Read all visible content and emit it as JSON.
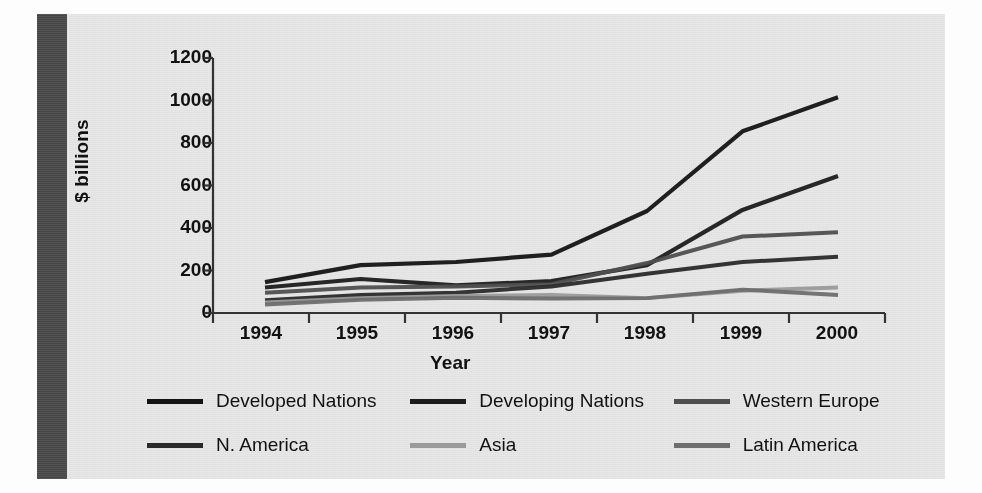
{
  "figure": {
    "background_color": "#e8e8e8",
    "spine_color": "#4a4a4a"
  },
  "chart_data": {
    "type": "line",
    "title": "",
    "xlabel": "Year",
    "ylabel": "$ billions",
    "categories": [
      "1994",
      "1995",
      "1996",
      "1997",
      "1998",
      "1999",
      "2000"
    ],
    "ylim": [
      0,
      1200
    ],
    "yticks": [
      0,
      200,
      400,
      600,
      800,
      1000,
      1200
    ],
    "ytick_labels": [
      "0",
      "200",
      "400",
      "600",
      "800",
      "1000",
      "1200"
    ],
    "grid": false,
    "legend_position": "bottom",
    "series": [
      {
        "name": "Developed Nations",
        "color": "#141414",
        "width": 4.2,
        "values": [
          145,
          225,
          240,
          275,
          480,
          855,
          1015
        ]
      },
      {
        "name": "Developing Nations",
        "color": "#1c1c1c",
        "width": 4.2,
        "values": [
          120,
          160,
          130,
          150,
          225,
          485,
          645
        ]
      },
      {
        "name": "Western Europe",
        "color": "#4f4f4f",
        "width": 4.0,
        "values": [
          95,
          120,
          125,
          135,
          235,
          360,
          380
        ]
      },
      {
        "name": "N. America",
        "color": "#2a2a2a",
        "width": 4.0,
        "values": [
          60,
          85,
          95,
          125,
          185,
          240,
          265
        ]
      },
      {
        "name": "Asia",
        "color": "#9a9a9a",
        "width": 4.0,
        "values": [
          50,
          70,
          80,
          85,
          70,
          105,
          120
        ]
      },
      {
        "name": "Latin America",
        "color": "#6e6e6e",
        "width": 4.0,
        "values": [
          40,
          62,
          72,
          68,
          70,
          110,
          85
        ]
      }
    ]
  }
}
